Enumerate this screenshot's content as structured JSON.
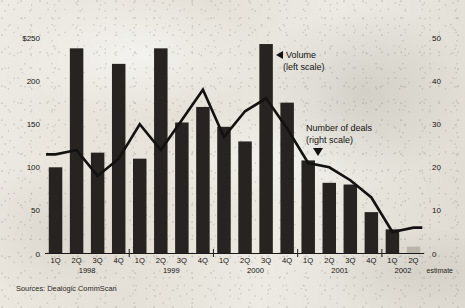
{
  "chart_data": {
    "type": "bar",
    "title": "",
    "subtitle": "",
    "xlabel": "",
    "ylabel": "",
    "grid": false,
    "legend_position": "inline-annotation",
    "categories": [
      "1Q 1998",
      "2Q 1998",
      "3Q 1998",
      "4Q 1998",
      "1Q 1999",
      "2Q 1999",
      "3Q 1999",
      "4Q 1999",
      "1Q 2000",
      "2Q 2000",
      "3Q 2000",
      "4Q 2000",
      "1Q 2001",
      "2Q 2001",
      "3Q 2001",
      "4Q 2001",
      "1Q 2002",
      "2Q 2002"
    ],
    "quarter_labels": [
      "1Q",
      "2Q",
      "3Q",
      "4Q",
      "1Q",
      "2Q",
      "3Q",
      "4Q",
      "1Q",
      "2Q",
      "3Q",
      "4Q",
      "1Q",
      "2Q",
      "3Q",
      "4Q",
      "1Q",
      "2Q"
    ],
    "year_labels": [
      "1998",
      "1999",
      "2000",
      "2001",
      "2002"
    ],
    "estimate_note": "estimate",
    "estimate_index": 17,
    "series": [
      {
        "name": "Volume (left scale)",
        "type": "bar",
        "axis": "left",
        "unit": "$ billions",
        "values": [
          100,
          238,
          117,
          220,
          110,
          238,
          152,
          170,
          147,
          130,
          243,
          175,
          108,
          82,
          80,
          48,
          28,
          8
        ]
      },
      {
        "name": "Number of deals (right scale)",
        "type": "line",
        "axis": "right",
        "unit": "deals",
        "values": [
          23,
          24,
          18,
          22,
          30,
          24,
          31,
          38,
          27,
          33,
          36,
          29,
          21,
          20,
          17,
          13,
          5,
          6
        ]
      }
    ],
    "left_axis": {
      "ticks": [
        "$250",
        "200",
        "150",
        "100",
        "50",
        "0"
      ],
      "values": [
        250,
        200,
        150,
        100,
        50,
        0
      ],
      "ylim": [
        0,
        250
      ]
    },
    "right_axis": {
      "ticks": [
        "50",
        "40",
        "30",
        "20",
        "10",
        "0"
      ],
      "values": [
        50,
        40,
        30,
        20,
        10,
        0
      ],
      "ylim": [
        0,
        50
      ]
    },
    "annotations": [
      {
        "id": "volume",
        "line1": "Volume",
        "line2": "(left scale)",
        "marker": "left-triangle"
      },
      {
        "id": "deals",
        "line1": "Number of deals",
        "line2": "(right scale)",
        "marker": "down-triangle"
      }
    ],
    "source": "Sources: Dealogic CommScan",
    "colors": {
      "bar": "#262320",
      "bar_estimate": "#b9b5ab",
      "line": "#141210",
      "text": "#151310",
      "paper": "#e9e6df"
    }
  }
}
